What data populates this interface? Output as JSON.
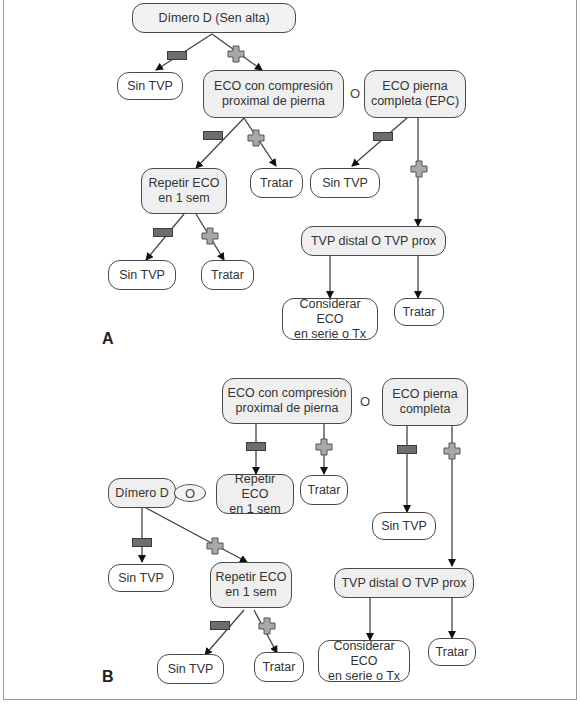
{
  "panels": {
    "A": {
      "label": "A",
      "nodes": {
        "dimero": "Dímero D (Sen alta)",
        "sin_tvp_1": "Sin TVP",
        "eco_prox": "ECO con compresión\nproximal de pierna",
        "conj_o": "O",
        "eco_completa": "ECO pierna\ncompleta (EPC)",
        "repetir": "Repetir ECO\nen 1 sem",
        "tratar_1": "Tratar",
        "sin_tvp_2": "Sin TVP",
        "sin_tvp_3": "Sin TVP",
        "tratar_2": "Tratar",
        "tvp_distal": "TVP distal O TVP prox",
        "considerar": "Considerar ECO\nen serie o Tx",
        "tratar_3": "Tratar"
      }
    },
    "B": {
      "label": "B",
      "nodes": {
        "eco_prox": "ECO con compresión\nproximal de pierna",
        "conj_o_1": "O",
        "eco_completa": "ECO pierna\ncompleta",
        "dimero": "Dímero D",
        "conj_o_2": "O",
        "repetir_1": "Repetir ECO\nen 1 sem",
        "tratar_1": "Tratar",
        "sin_tvp_1": "Sin TVP",
        "sin_tvp_2": "Sin TVP",
        "repetir_2": "Repetir ECO\nen 1 sem",
        "tvp_distal": "TVP distal O TVP prox",
        "sin_tvp_3": "Sin TVP",
        "tratar_2": "Tratar",
        "considerar": "Considerar ECO\nen serie o Tx",
        "tratar_3": "Tratar"
      }
    }
  },
  "legend_symbols": {
    "negative": "minus-sign",
    "positive": "plus-sign"
  },
  "colors": {
    "shaded_node": "#efefef",
    "border": "#4a4a4a",
    "minus_fill": "#6e6e6e",
    "plus_fill": "#a8a8a8"
  }
}
